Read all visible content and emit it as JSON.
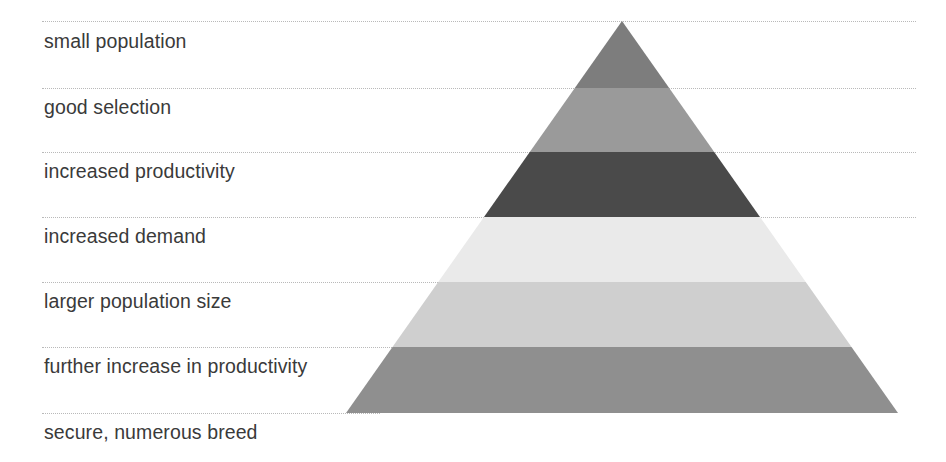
{
  "diagram": {
    "type": "pyramid",
    "title": "",
    "orientation": "apex-up",
    "canvas": {
      "width": 946,
      "height": 462
    },
    "background_color": "#ffffff",
    "geometry": {
      "apex_x": 622,
      "apex_y": 21,
      "base_left_x": 346,
      "base_right_x": 898,
      "base_y": 413
    },
    "guide_line_color": "#b9b9b9",
    "label_color": "#3a3a3a",
    "levels": [
      {
        "index": 1,
        "label": "small population",
        "color": "#7d7d7d",
        "top_y": 21,
        "bottom_y": 88,
        "label_y": 30
      },
      {
        "index": 2,
        "label": "good selection",
        "color": "#9a9a9a",
        "top_y": 88,
        "bottom_y": 152,
        "label_y": 96
      },
      {
        "index": 3,
        "label": "increased productivity",
        "color": "#4a4a4a",
        "top_y": 152,
        "bottom_y": 217,
        "label_y": 160
      },
      {
        "index": 4,
        "label": "increased demand",
        "color": "#eaeaea",
        "top_y": 217,
        "bottom_y": 282,
        "label_y": 225
      },
      {
        "index": 5,
        "label": "larger population size",
        "color": "#cfcfcf",
        "top_y": 282,
        "bottom_y": 347,
        "label_y": 290
      },
      {
        "index": 6,
        "label": "further increase in productivity",
        "color": "#8f8f8f",
        "top_y": 347,
        "bottom_y": 413,
        "label_y": 355
      },
      {
        "index": 7,
        "label": "secure, numerous breed",
        "color": "",
        "top_y": 413,
        "bottom_y": 462,
        "label_y": 421
      }
    ],
    "guides": [
      {
        "y": 21,
        "right_x": 916
      },
      {
        "y": 88,
        "right_x": 916
      },
      {
        "y": 152,
        "right_x": 916
      },
      {
        "y": 217,
        "right_x": 916
      },
      {
        "y": 282,
        "right_x": 772
      },
      {
        "y": 347,
        "right_x": 640
      },
      {
        "y": 413,
        "right_x": 380
      }
    ]
  }
}
